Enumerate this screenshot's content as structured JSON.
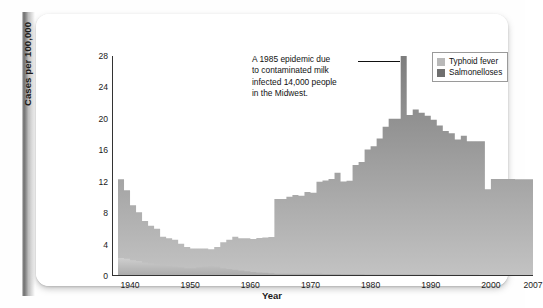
{
  "figure": {
    "background_color": "#ffffff",
    "spine_color": "#7a7a7a"
  },
  "chart_data": {
    "type": "area",
    "subtype": "stacked-step-area",
    "title": "",
    "xlabel": "Year",
    "ylabel": "Cases per 100,000",
    "xlim": [
      1937,
      2007
    ],
    "ylim": [
      0,
      28
    ],
    "ytick_labels": [
      "0",
      "4",
      "8",
      "12",
      "16",
      "20",
      "24",
      "28"
    ],
    "ytick_values": [
      0,
      4,
      8,
      12,
      16,
      20,
      24,
      28
    ],
    "xtick_labels": [
      "1940",
      "1950",
      "1960",
      "1970",
      "1980",
      "1990",
      "2000",
      "2007"
    ],
    "xtick_values": [
      1940,
      1950,
      1960,
      1970,
      1980,
      1990,
      2000,
      2007
    ],
    "xtick_minor_values": [
      1945,
      1955,
      1965,
      1975,
      1985,
      1995,
      2005
    ],
    "grid": false,
    "legend_position": "top-right",
    "x": [
      1938,
      1939,
      1940,
      1941,
      1942,
      1943,
      1944,
      1945,
      1946,
      1947,
      1948,
      1949,
      1950,
      1951,
      1952,
      1953,
      1954,
      1955,
      1956,
      1957,
      1958,
      1959,
      1960,
      1961,
      1962,
      1963,
      1964,
      1965,
      1966,
      1967,
      1968,
      1969,
      1970,
      1971,
      1972,
      1973,
      1974,
      1975,
      1976,
      1977,
      1978,
      1979,
      1980,
      1981,
      1982,
      1983,
      1984,
      1985,
      1986,
      1987,
      1988,
      1989,
      1990,
      1991,
      1992,
      1993,
      1994,
      1995,
      1996,
      1997,
      1998,
      1999,
      2000,
      2001,
      2002,
      2003,
      2004,
      2005,
      2006,
      2007
    ],
    "series": [
      {
        "name": "Typhoid fever",
        "color": "#b9b9b9",
        "values": [
          2.3,
          2.2,
          2.0,
          1.9,
          1.7,
          1.6,
          1.5,
          1.4,
          1.3,
          1.2,
          1.1,
          1.0,
          1.0,
          1.1,
          1.2,
          1.3,
          1.2,
          1.0,
          0.9,
          0.8,
          0.7,
          0.6,
          0.5,
          0.45,
          0.4,
          0.35,
          0.3,
          0.3,
          0.3,
          0.3,
          0.3,
          0.3,
          0.3,
          0.28,
          0.26,
          0.25,
          0.24,
          0.23,
          0.22,
          0.22,
          0.21,
          0.2,
          0.2,
          0.2,
          0.2,
          0.2,
          0.2,
          0.2,
          0.2,
          0.2,
          0.19,
          0.18,
          0.18,
          0.17,
          0.17,
          0.16,
          0.16,
          0.15,
          0.15,
          0.15,
          0.14,
          0.14,
          0.14,
          0.13,
          0.13,
          0.13,
          0.12,
          0.12,
          0.12,
          0.12
        ]
      },
      {
        "name": "Salmonelloses",
        "color": "#6f6f6f",
        "values": [
          10.0,
          8.7,
          7.0,
          6.2,
          5.3,
          4.8,
          4.5,
          3.6,
          3.5,
          3.4,
          3.0,
          2.7,
          2.5,
          2.4,
          2.3,
          2.1,
          2.5,
          3.3,
          3.7,
          4.2,
          4.1,
          4.2,
          4.2,
          4.4,
          4.5,
          4.6,
          9.5,
          9.5,
          9.8,
          10.0,
          9.9,
          10.4,
          10.3,
          11.7,
          11.9,
          12.1,
          12.9,
          11.8,
          11.9,
          13.9,
          14.3,
          15.9,
          16.3,
          17.3,
          18.8,
          19.8,
          19.8,
          27.8,
          20.3,
          21.0,
          20.6,
          20.2,
          19.7,
          19.0,
          18.3,
          18.0,
          17.2,
          17.7,
          17.0,
          17.0,
          17.0,
          10.9,
          12.2,
          12.2,
          12.2,
          12.2,
          12.2,
          12.2,
          12.2,
          12.2
        ]
      }
    ],
    "annotation": {
      "lines": [
        "A 1985 epidemic due",
        "to contaminated milk",
        "infected 14,000 people",
        "in the Midwest."
      ],
      "points_to_year": 1985,
      "points_to_value": 28
    }
  },
  "legend": {
    "items": [
      {
        "label": "Typhoid fever",
        "color": "#b9b9b9"
      },
      {
        "label": "Salmonelloses",
        "color": "#6f6f6f"
      }
    ]
  }
}
